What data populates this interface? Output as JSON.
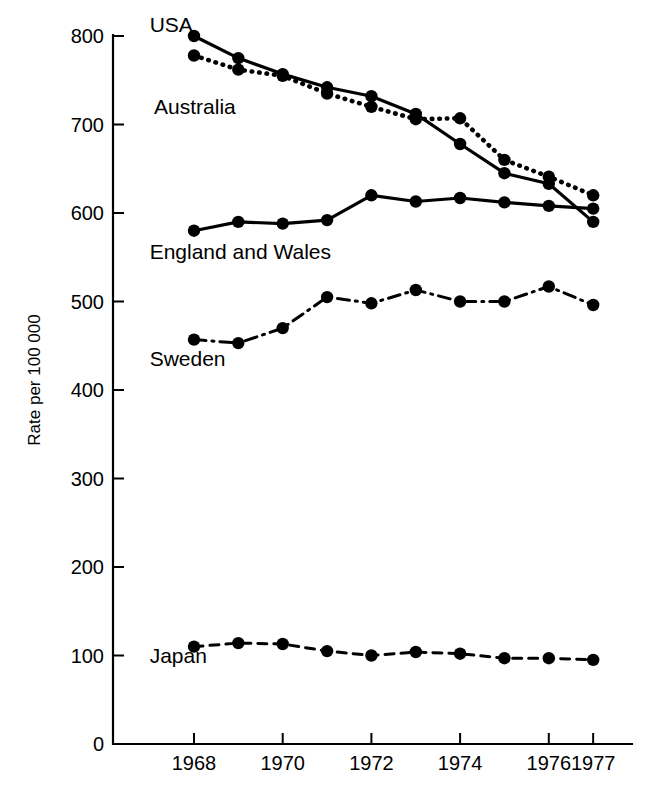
{
  "chart_data": {
    "type": "line",
    "title": "",
    "subtitle": "",
    "xlabel": "",
    "ylabel": "Rate per 100 000",
    "x": [
      1968,
      1969,
      1970,
      1971,
      1972,
      1973,
      1974,
      1975,
      1976,
      1977
    ],
    "xlim": [
      1967.4,
      1977.6
    ],
    "ylim": [
      0,
      800
    ],
    "xticks": [
      1968,
      1970,
      1972,
      1974,
      1976,
      1977
    ],
    "xticklabels": [
      "1968",
      "1970",
      "1972",
      "1974",
      "1976",
      "1977"
    ],
    "yticks": [
      0,
      100,
      200,
      300,
      400,
      500,
      600,
      700,
      800
    ],
    "yticklabels": [
      "0",
      "100",
      "200",
      "300",
      "400",
      "500",
      "600",
      "700",
      "800"
    ],
    "grid": false,
    "legend_position": "inline-labels",
    "series": [
      {
        "name": "USA",
        "linestyle": "solid",
        "color": "#000000",
        "label_x": 1967.0,
        "label_y": 805,
        "values": [
          800,
          775,
          757,
          742,
          732,
          712,
          678,
          645,
          633,
          590
        ]
      },
      {
        "name": "Australia",
        "linestyle": "dotted",
        "color": "#000000",
        "label_x": 1967.1,
        "label_y": 712,
        "values": [
          778,
          762,
          755,
          735,
          720,
          706,
          707,
          660,
          641,
          620
        ]
      },
      {
        "name": "England and Wales",
        "linestyle": "solid",
        "color": "#000000",
        "label_x": 1967.0,
        "label_y": 548,
        "values": [
          580,
          590,
          588,
          592,
          620,
          613,
          617,
          612,
          608,
          605
        ]
      },
      {
        "name": "Sweden",
        "linestyle": "dashdot",
        "color": "#000000",
        "label_x": 1967.0,
        "label_y": 427,
        "values": [
          457,
          453,
          470,
          505,
          498,
          513,
          500,
          500,
          517,
          496
        ]
      },
      {
        "name": "Japan",
        "linestyle": "dashed",
        "color": "#000000",
        "label_x": 1967.0,
        "label_y": 92,
        "values": [
          110,
          114,
          113,
          105,
          100,
          104,
          102,
          97,
          97,
          95
        ]
      }
    ]
  }
}
